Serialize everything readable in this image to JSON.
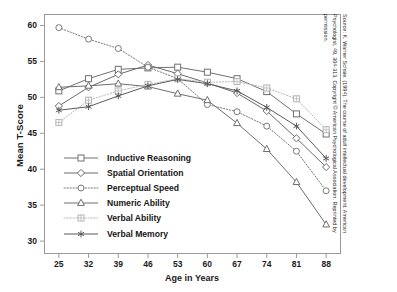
{
  "figure": {
    "background": "#ffffff",
    "frame_color": "#9a9a9a"
  },
  "axes": {
    "ylabel": "Mean T-Score",
    "xlabel": "Age in Years",
    "yticks": [
      30,
      35,
      40,
      45,
      50,
      55,
      60
    ],
    "xticks": [
      25,
      32,
      39,
      46,
      53,
      60,
      67,
      74,
      81,
      88
    ],
    "ylim": [
      28.2,
      61.6
    ],
    "xlim": [
      21.5,
      91.5
    ]
  },
  "legend": {
    "position": "inside-lower-left",
    "entries": [
      {
        "label": "Inductive Reasoning",
        "marker": "square",
        "dash": "solid",
        "color": "#707070"
      },
      {
        "label": "Spatial Orientation",
        "marker": "diamond",
        "dash": "solid",
        "color": "#6b6b6b"
      },
      {
        "label": "Perceptual Speed",
        "marker": "circle",
        "dash": "dotted",
        "color": "#7a7a7a"
      },
      {
        "label": "Numeric Ability",
        "marker": "triangle",
        "dash": "solid",
        "color": "#6e6e6e"
      },
      {
        "label": "Verbal Ability",
        "marker": "square-grid",
        "dash": "dotted",
        "color": "#b9b9b9"
      },
      {
        "label": "Verbal Memory",
        "marker": "asterisk",
        "dash": "solid",
        "color": "#5a5a5a"
      }
    ]
  },
  "source_note": "Source: K. Warner Schaie. (1994). The course of adult intellectual development. American Psychologist, 49, 304-313. Copyright © American Psychological Association. Reprinted by permission.",
  "chart_data": {
    "type": "line",
    "title": "",
    "xlabel": "Age in Years",
    "ylabel": "Mean T-Score",
    "x": [
      25,
      32,
      39,
      46,
      53,
      60,
      67,
      74,
      81,
      88
    ],
    "xlim": [
      21.5,
      91.5
    ],
    "ylim": [
      28.2,
      61.6
    ],
    "grid": false,
    "legend_position": "inside-lower-left",
    "series": [
      {
        "name": "Inductive Reasoning",
        "marker": "square",
        "dash": "solid",
        "color": "#707070",
        "values": [
          50.9,
          52.6,
          53.9,
          54.1,
          54.2,
          53.5,
          52.6,
          50.8,
          47.7,
          44.9
        ]
      },
      {
        "name": "Spatial Orientation",
        "marker": "diamond",
        "dash": "solid",
        "color": "#6b6b6b",
        "values": [
          48.8,
          51.4,
          53.2,
          54.5,
          53.3,
          52.0,
          50.6,
          48.1,
          44.3,
          40.3
        ]
      },
      {
        "name": "Perceptual Speed",
        "marker": "circle",
        "dash": "dotted",
        "color": "#7a7a7a",
        "values": [
          59.7,
          58.1,
          56.8,
          54.2,
          52.6,
          49.0,
          48.0,
          46.0,
          42.5,
          37.0
        ]
      },
      {
        "name": "Numeric Ability",
        "marker": "triangle",
        "dash": "solid",
        "color": "#6e6e6e",
        "values": [
          51.4,
          51.6,
          51.9,
          51.5,
          50.5,
          49.6,
          46.4,
          42.8,
          38.2,
          32.3
        ]
      },
      {
        "name": "Verbal Ability",
        "marker": "square-grid",
        "dash": "dotted",
        "color": "#b9b9b9",
        "values": [
          46.5,
          49.6,
          50.9,
          51.8,
          52.6,
          52.1,
          52.2,
          51.3,
          49.8,
          45.5
        ]
      },
      {
        "name": "Verbal Memory",
        "marker": "asterisk",
        "dash": "solid",
        "color": "#5a5a5a",
        "values": [
          48.2,
          48.7,
          50.2,
          51.6,
          52.5,
          51.9,
          50.9,
          48.6,
          46.0,
          41.5
        ]
      }
    ]
  }
}
